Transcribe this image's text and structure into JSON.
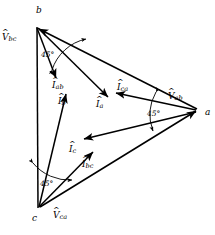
{
  "figure": {
    "type": "phasor-diagram",
    "stroke_color": "#000000",
    "background_color": "#ffffff"
  },
  "vertices": [
    {
      "id": "b",
      "label": "b",
      "x": 37,
      "y": 27
    },
    {
      "id": "a",
      "label": "a",
      "x": 198,
      "y": 110
    },
    {
      "id": "c",
      "label": "c",
      "x": 38,
      "y": 208
    }
  ],
  "voltages": [
    {
      "id": "V_bc",
      "base": "V",
      "sub": "bc",
      "hat": "^",
      "x": 2,
      "y": 33
    },
    {
      "id": "V_ab",
      "base": "V",
      "sub": "ab",
      "hat": "^",
      "x": 168,
      "y": 92
    },
    {
      "id": "V_ca",
      "base": "V",
      "sub": "ca",
      "hat": "^",
      "x": 53,
      "y": 211
    }
  ],
  "phase_currents": [
    {
      "id": "I_ab",
      "base": "I",
      "sub": "ab",
      "hat": "^",
      "x": 52,
      "y": 81
    },
    {
      "id": "I_bc",
      "base": "I",
      "sub": "bc",
      "hat": "^",
      "x": 82,
      "y": 160
    },
    {
      "id": "I_ca",
      "base": "I",
      "sub": "ca",
      "hat": "^",
      "x": 117,
      "y": 83
    }
  ],
  "line_currents": [
    {
      "id": "I_a",
      "base": "I",
      "sub": "a",
      "hat": "^",
      "x": 96,
      "y": 100
    },
    {
      "id": "I_b",
      "base": "I",
      "sub": "b",
      "hat": "^",
      "x": 58,
      "y": 97
    },
    {
      "id": "I_c",
      "base": "I",
      "sub": "c",
      "hat": "^",
      "x": 69,
      "y": 145
    }
  ],
  "angles": [
    {
      "id": "angle-b",
      "label": "45°",
      "x": 41,
      "y": 51
    },
    {
      "id": "angle-a",
      "label": "45°",
      "x": 147,
      "y": 110
    },
    {
      "id": "angle-c",
      "label": "45°",
      "x": 40,
      "y": 180
    }
  ]
}
